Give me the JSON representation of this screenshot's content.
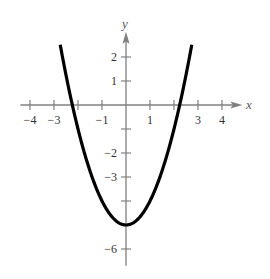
{
  "chart_data": {
    "type": "line",
    "title": "",
    "xlabel": "x",
    "ylabel": "y",
    "xlim": [
      -4.5,
      4.7
    ],
    "ylim": [
      -6.7,
      3.0
    ],
    "grid": false,
    "x_ticks": [
      -4,
      -3,
      -2,
      -1,
      1,
      2,
      3,
      4
    ],
    "x_tick_labels": [
      "−4",
      "−3",
      "",
      "−1",
      "1",
      "",
      "3",
      "4"
    ],
    "y_ticks": [
      2,
      1,
      -1,
      -2,
      -3,
      -4,
      -5,
      -6
    ],
    "y_tick_labels": [
      "2",
      "1",
      "",
      "−2",
      "−3",
      "",
      "",
      "−6"
    ],
    "series": [
      {
        "name": "y = x^2 - 5",
        "equation": "y = x^2 - 5",
        "x": [
          -2.74,
          -2.5,
          -2,
          -1.5,
          -1,
          -0.5,
          0,
          0.5,
          1,
          1.5,
          2,
          2.5,
          2.74
        ],
        "y": [
          2.5,
          1.25,
          -1,
          -2.75,
          -4,
          -4.75,
          -5,
          -4.75,
          -4,
          -2.75,
          -1,
          1.25,
          2.5
        ]
      }
    ],
    "colors": {
      "curve": "#000000",
      "axes": "#808080",
      "text": "#333333"
    }
  }
}
